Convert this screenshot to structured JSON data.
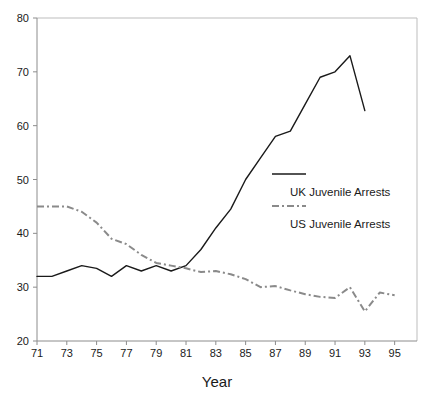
{
  "chart_data": {
    "type": "line",
    "title": "",
    "xlabel": "Year",
    "ylabel": "",
    "xlim": [
      71,
      96.5
    ],
    "ylim": [
      20,
      80
    ],
    "grid": false,
    "legend_position": "center-right",
    "x": [
      71,
      72,
      73,
      74,
      75,
      76,
      77,
      78,
      79,
      80,
      81,
      82,
      83,
      84,
      85,
      86,
      87,
      88,
      89,
      90,
      91,
      92,
      93,
      94,
      95
    ],
    "xticks": [
      "71",
      "73",
      "75",
      "77",
      "79",
      "81",
      "83",
      "85",
      "87",
      "89",
      "91",
      "93",
      "95"
    ],
    "xtick_values": [
      71,
      73,
      75,
      77,
      79,
      81,
      83,
      85,
      87,
      89,
      91,
      93,
      95
    ],
    "yticks": [
      "20",
      "30",
      "40",
      "50",
      "60",
      "70",
      "80"
    ],
    "ytick_values": [
      20,
      30,
      40,
      50,
      60,
      70,
      80
    ],
    "series": [
      {
        "name": "UK Juvenile Arrests",
        "style": "solid",
        "color": "#1a1a1a",
        "x": [
          71,
          72,
          73,
          74,
          75,
          76,
          77,
          78,
          79,
          80,
          81,
          82,
          83,
          84,
          85,
          86,
          87,
          88,
          89,
          90,
          91,
          92,
          93
        ],
        "values": [
          32,
          32,
          33,
          34,
          33.5,
          32,
          34,
          33,
          34,
          33,
          34,
          37,
          41,
          44.5,
          50,
          54,
          58,
          59,
          64,
          69,
          70,
          73,
          62.8
        ]
      },
      {
        "name": "US Juvenile Arrests",
        "style": "dash-dot",
        "color": "#8a8a8a",
        "x": [
          71,
          72,
          73,
          74,
          75,
          76,
          77,
          78,
          79,
          80,
          81,
          82,
          83,
          84,
          85,
          86,
          87,
          88,
          89,
          90,
          91,
          92,
          93,
          94,
          95
        ],
        "values": [
          45,
          45,
          45,
          44,
          42,
          39,
          38,
          36,
          34.5,
          34,
          33.5,
          32.8,
          33,
          32.4,
          31.5,
          30,
          30.2,
          29.4,
          28.7,
          28.2,
          28,
          30,
          25.5,
          29,
          28.5
        ]
      }
    ]
  },
  "legend": {
    "items": [
      {
        "label": "UK Juvenile Arrests",
        "style": "solid",
        "color": "#1a1a1a"
      },
      {
        "label": "US Juvenile Arrests",
        "style": "dash-dot",
        "color": "#8a8a8a"
      }
    ]
  },
  "axis": {
    "x_title": "Year"
  }
}
